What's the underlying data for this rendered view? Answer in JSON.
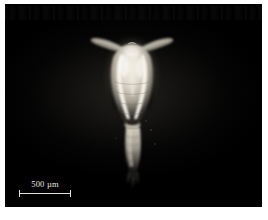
{
  "figure": {
    "kind": "darkfield-photomicrograph",
    "background_color": "#000000",
    "page_color": "#ffffff",
    "specimen_color": "#d8d4c8"
  },
  "scale_bar": {
    "label": "500 µm",
    "value": 500,
    "unit": "µm",
    "position": "bottom-left",
    "color": "#e3e1dd"
  }
}
